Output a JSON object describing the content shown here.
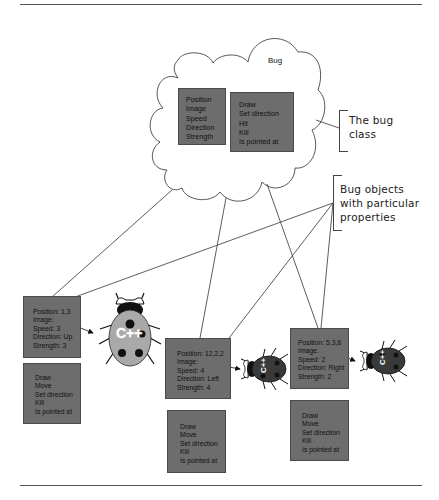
{
  "diagram": {
    "class_cloud": {
      "title": "Bug",
      "properties": [
        "Position",
        "Image",
        "Speed",
        "Direction",
        "Strength"
      ],
      "methods": [
        "Draw",
        "Set direction",
        "Hit",
        "Kill",
        "Is pointed at"
      ]
    },
    "annotations": {
      "class_note": [
        "The bug",
        "class"
      ],
      "objects_note": [
        "Bug objects",
        "with particular",
        "properties"
      ]
    },
    "objects": [
      {
        "properties": [
          "Position: 1,3",
          "Image:",
          "Speed: 3",
          "Direction:  Up",
          "Strength: 3"
        ],
        "methods": [
          "Draw",
          "Move",
          "Set direction",
          "Kill",
          "Is pointed at"
        ],
        "bug_label": "C++",
        "bug_color": "#a9a9a9"
      },
      {
        "properties": [
          "Position: 12,2,2",
          "Image:",
          "Speed: 4",
          "Direction: Left",
          "Strength: 4"
        ],
        "methods": [
          "Draw",
          "Move",
          "Set direction",
          "Kill",
          "Is pointed at"
        ],
        "bug_label": "C++",
        "bug_color": "#3a3a3a"
      },
      {
        "properties": [
          "Position: 5,3,8",
          "Image:",
          "Speed: 2",
          "Direction: Right",
          "Strength: 2"
        ],
        "methods": [
          "Draw",
          "Move",
          "Set direction",
          "Kill",
          "Is pointed at"
        ],
        "bug_label": "C++",
        "bug_color": "#3a3a3a"
      }
    ],
    "colors": {
      "box_fill": "#6d6d6d",
      "line": "#333333",
      "background": "#ffffff"
    }
  }
}
